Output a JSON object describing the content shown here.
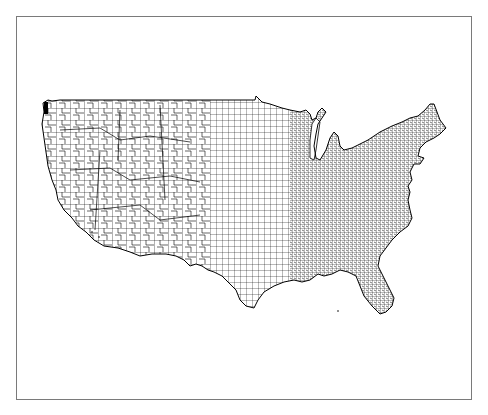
{
  "figure": {
    "type": "choropleth-outline",
    "line_color": "#000000",
    "fill_color": "#ffffff",
    "frame_color": "#7a7a7a",
    "background": "#ffffff"
  },
  "map": {
    "regions": {
      "west_density": "sparse",
      "central_density": "medium",
      "east_density": "dense"
    }
  }
}
